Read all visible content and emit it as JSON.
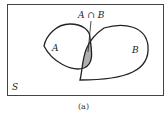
{
  "diagram": {
    "type": "venn",
    "universe_label": "S",
    "set_a_label": "A",
    "set_b_label": "B",
    "intersection_label": "A ∩ B",
    "caption": "(a)",
    "colors": {
      "outline": "#222222",
      "intersection_fill": "#b0b0b0",
      "background": "#ffffff"
    }
  }
}
